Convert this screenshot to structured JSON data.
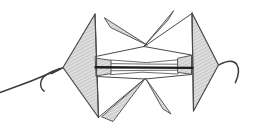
{
  "meta": {
    "canvas": {
      "width": 267,
      "height": 132
    },
    "background": "#ffffff"
  },
  "palette": {
    "outline": "#4a4a4a",
    "dark_line": "#1e1e1e",
    "string": "#3c3c3c",
    "paper_shade": "#dedede",
    "hatch_line": "#c6c6c6",
    "paper_white": "#ffffff"
  },
  "figure": {
    "name": "two-kite-spinner-on-string",
    "shapes": [
      {
        "name": "left-string",
        "type": "path",
        "d": "M0,92.5 Q32,81.5 63.5,67.5",
        "stroke": "string",
        "width": 1.5,
        "fill": "none"
      },
      {
        "name": "left-string-curl",
        "type": "path",
        "d": "M60.5,68.7 C52,71 43,75.5 41.2,80.8 C39.8,85.5 41.6,89.4 44.2,91.2",
        "stroke": "string",
        "width": 1.4,
        "fill": "none"
      },
      {
        "name": "left-string-curl-overlap",
        "type": "path",
        "d": "M51.5,73.2 C54.5,71.8 57.5,70.2 60,68.8",
        "stroke": "string",
        "width": 2.2,
        "fill": "none"
      },
      {
        "name": "right-string",
        "type": "path",
        "d": "M219,64.8 C227,60.6 233.6,60.2 236.6,64.2 C239.6,68.8 238.4,76.2 235.4,82.6",
        "stroke": "string",
        "width": 1.5,
        "fill": "none"
      },
      {
        "name": "left-kite-panel",
        "type": "polygon",
        "points": [
          [
            63,
            67.5
          ],
          [
            95,
            14
          ],
          [
            98.5,
            117.5
          ]
        ],
        "fill": "hatch",
        "stroke": "outline",
        "width": 1.2
      },
      {
        "name": "right-kite-panel",
        "type": "polygon",
        "points": [
          [
            218.5,
            65
          ],
          [
            192,
            13
          ],
          [
            193.5,
            111
          ]
        ],
        "fill": "hatch",
        "stroke": "outline",
        "width": 1.2
      },
      {
        "name": "top-right-flap-crease",
        "type": "line",
        "from": [
          143.5,
          47
        ],
        "to": [
          192,
          13.5
        ],
        "stroke": "outline",
        "width": 1,
        "fill": "none"
      },
      {
        "name": "bottom-left-flap-crease",
        "type": "line",
        "from": [
          145,
          78.5
        ],
        "to": [
          99,
          117
        ],
        "stroke": "outline",
        "width": 1,
        "fill": "none"
      },
      {
        "name": "center-band",
        "type": "polygon",
        "points": [
          [
            95.5,
            56.5
          ],
          [
            144,
            46.5
          ],
          [
            191.5,
            55
          ],
          [
            191.5,
            74.5
          ],
          [
            145,
            79
          ],
          [
            96.5,
            76.5
          ]
        ],
        "fill": "paper_white",
        "stroke": "outline",
        "width": 1
      },
      {
        "name": "left-kite-inner-edge",
        "type": "line",
        "from": [
          95,
          14
        ],
        "to": [
          98.5,
          117.5
        ],
        "stroke": "outline",
        "width": 1,
        "fill": "none"
      },
      {
        "name": "right-kite-inner-edge",
        "type": "line",
        "from": [
          192,
          13
        ],
        "to": [
          193.5,
          111
        ],
        "stroke": "outline",
        "width": 1,
        "fill": "none"
      },
      {
        "name": "top-pleat",
        "type": "polygon",
        "points": [
          [
            111,
            60
          ],
          [
            146.5,
            62.6
          ],
          [
            178,
            59.8
          ],
          [
            178,
            64.2
          ],
          [
            146.5,
            64.1
          ],
          [
            111,
            63.6
          ]
        ],
        "fill": "paper_white",
        "stroke": "outline",
        "width": 0.8
      },
      {
        "name": "bottom-pleat",
        "type": "polygon",
        "points": [
          [
            111,
            70.8
          ],
          [
            142,
            70.4
          ],
          [
            178,
            70.2
          ],
          [
            178,
            74
          ],
          [
            142,
            72.2
          ],
          [
            111,
            74.6
          ]
        ],
        "fill": "paper_white",
        "stroke": "outline",
        "width": 0.8
      },
      {
        "name": "left-shaded-pocket",
        "type": "polygon",
        "points": [
          [
            97,
            58.3
          ],
          [
            111,
            60.3
          ],
          [
            111,
            73.6
          ],
          [
            97,
            75.8
          ]
        ],
        "fill": "hatch",
        "stroke": "outline",
        "width": 0.9
      },
      {
        "name": "right-shaded-pocket",
        "type": "polygon",
        "points": [
          [
            178,
            58.2
          ],
          [
            191.5,
            55.3
          ],
          [
            191.5,
            74.3
          ],
          [
            178,
            72.4
          ]
        ],
        "fill": "hatch",
        "stroke": "outline",
        "width": 0.9
      },
      {
        "name": "center-thread-line",
        "type": "line",
        "from": [
          95.5,
          67.2
        ],
        "to": [
          192.5,
          67.9
        ],
        "stroke": "dark_line",
        "width": 2.4,
        "fill": "none"
      },
      {
        "name": "top-left-sliver-flap",
        "type": "polygon",
        "points": [
          [
            104.5,
            18
          ],
          [
            110.5,
            27.5
          ],
          [
            147,
            45
          ]
        ],
        "fill": "hatch",
        "stroke": "outline",
        "width": 0.9
      },
      {
        "name": "top-right-sliver-flap",
        "type": "polygon",
        "points": [
          [
            173.5,
            11
          ],
          [
            168,
            20
          ],
          [
            143.5,
            46.8
          ]
        ],
        "fill": "hatch",
        "stroke": "outline",
        "width": 0.9
      },
      {
        "name": "bottom-left-sliver-flap",
        "type": "polygon",
        "points": [
          [
            102,
            117
          ],
          [
            113,
            121.5
          ],
          [
            145,
            78.8
          ]
        ],
        "fill": "hatch",
        "stroke": "outline",
        "width": 0.9
      },
      {
        "name": "bottom-right-sliver-flap",
        "type": "polygon",
        "points": [
          [
            163,
            109
          ],
          [
            171,
            114
          ],
          [
            146,
            79
          ]
        ],
        "fill": "hatch",
        "stroke": "outline",
        "width": 0.9
      }
    ]
  }
}
